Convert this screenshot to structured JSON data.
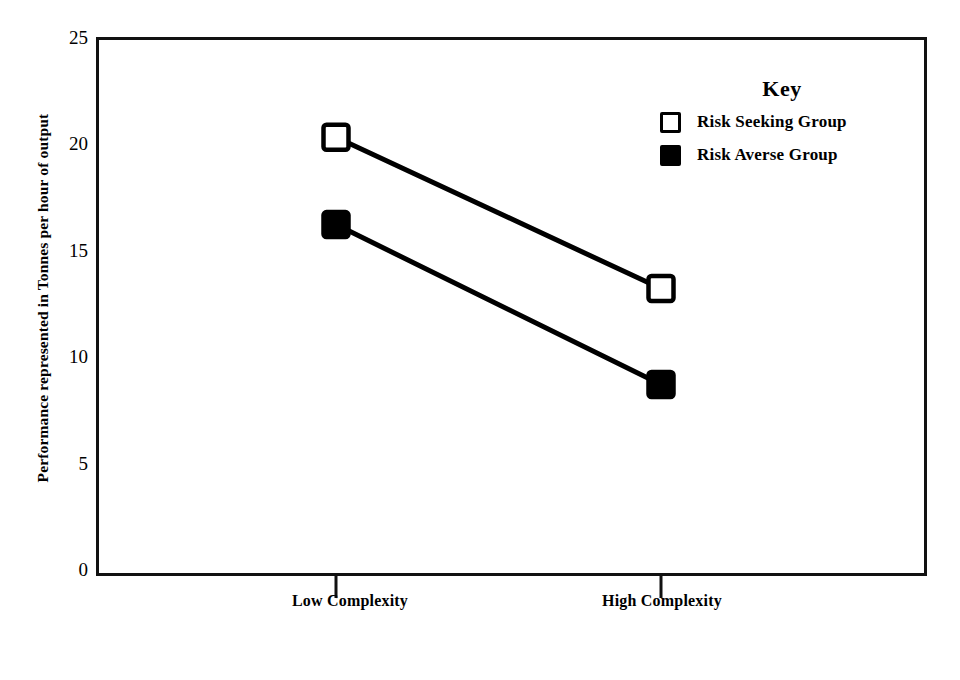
{
  "figure": {
    "clipped_top_text": "",
    "background_color": "#ffffff",
    "ink_color": "#000000"
  },
  "axes": {
    "y_title": "Performance represented in Tonnes per hour of output",
    "y_ticks": [
      "25",
      "20",
      "15",
      "10",
      "5",
      "0"
    ],
    "x_tick_labels": [
      "Low Complexity",
      "High Complexity"
    ]
  },
  "legend": {
    "title": "Key",
    "entries": [
      {
        "label": "Risk Seeking Group",
        "marker": "open-square",
        "color": "#ffffff"
      },
      {
        "label": "Risk Averse Group",
        "marker": "filled-square",
        "color": "#000000"
      }
    ]
  },
  "chart_data": {
    "type": "line",
    "title": "",
    "xlabel": "",
    "ylabel": "Performance represented in Tonnes per hour of output",
    "categories": [
      "Low Complexity",
      "High Complexity"
    ],
    "ylim": [
      0,
      25
    ],
    "ytick_values": [
      0,
      5,
      10,
      15,
      20,
      25
    ],
    "grid": false,
    "legend_position": "top-right-inside",
    "series": [
      {
        "name": "Risk Seeking Group",
        "marker": "open-square",
        "values": [
          20.3,
          13.2
        ]
      },
      {
        "name": "Risk Averse Group",
        "marker": "filled-square",
        "values": [
          16.2,
          8.7
        ]
      }
    ]
  }
}
